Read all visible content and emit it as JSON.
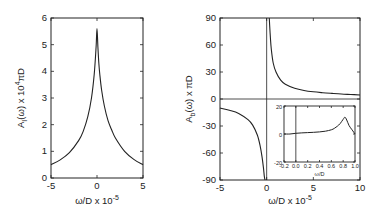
{
  "chart_data": [
    {
      "type": "line",
      "panel": "left",
      "ylabel": "A_I(ω) × 10^4 πD",
      "xlabel": "ω/D × 10^-5",
      "xlim": [
        -5,
        5
      ],
      "ylim": [
        0,
        6
      ],
      "xticks": [
        "-5",
        "0",
        "5"
      ],
      "yticks": [
        "0",
        "1",
        "2",
        "3",
        "4",
        "5",
        "6"
      ],
      "grid": false,
      "series": [
        {
          "name": "A_I",
          "x": [
            -5,
            -4,
            -3,
            -2,
            -1.5,
            -1,
            -0.6,
            -0.3,
            -0.1,
            0,
            0.1,
            0.2,
            0.3,
            0.5,
            0.8,
            1.2,
            1.6,
            2,
            3,
            4,
            5
          ],
          "y": [
            0.5,
            0.68,
            0.95,
            1.4,
            1.75,
            2.3,
            3.0,
            3.9,
            4.9,
            5.6,
            4.9,
            4.3,
            3.9,
            3.3,
            2.7,
            2.15,
            1.8,
            1.5,
            1.0,
            0.7,
            0.5
          ]
        }
      ]
    },
    {
      "type": "line",
      "panel": "right",
      "ylabel": "A_b(ω) × πD",
      "xlabel": "ω/D × 10^-5",
      "xlim": [
        -5,
        10
      ],
      "ylim": [
        -90,
        90
      ],
      "xticks": [
        "-5",
        "0",
        "5",
        "10"
      ],
      "yticks": [
        "-90",
        "-60",
        "-30",
        "0",
        "30",
        "60",
        "90"
      ],
      "grid": false,
      "reference_lines": {
        "y0": true,
        "x0": true
      },
      "series": [
        {
          "name": "A_b (ω<0)",
          "x": [
            -5,
            -4,
            -3,
            -2,
            -1.5,
            -1,
            -0.7,
            -0.5,
            -0.35,
            -0.25,
            -0.18
          ],
          "y": [
            -10,
            -12.5,
            -16,
            -23,
            -29,
            -40,
            -52,
            -64,
            -76,
            -86,
            -90
          ]
        },
        {
          "name": "A_b (ω>0)",
          "x": [
            0.28,
            0.32,
            0.4,
            0.5,
            0.7,
            1,
            1.5,
            2,
            3,
            4,
            5,
            6,
            7,
            8,
            9,
            10
          ],
          "y": [
            90,
            82,
            68,
            55,
            40,
            30,
            21,
            16.5,
            12,
            9.5,
            8,
            7,
            6.2,
            5.5,
            5,
            4.5
          ]
        }
      ],
      "inset": {
        "type": "line",
        "xlabel": "ω/D",
        "xlim": [
          -0.2,
          1.0
        ],
        "ylim": [
          -20,
          20
        ],
        "xticks": [
          "-0.2",
          "0.0",
          "0.2",
          "0.4",
          "0.6",
          "0.8",
          "1.0"
        ],
        "yticks": [
          "-20",
          "0",
          "20"
        ],
        "series": [
          {
            "name": "A_b wide range",
            "x": [
              -0.2,
              -0.1,
              0,
              0.1,
              0.2,
              0.3,
              0.4,
              0.5,
              0.6,
              0.65,
              0.7,
              0.75,
              0.8,
              0.83,
              0.86,
              0.9,
              0.95,
              1.0
            ],
            "y": [
              0,
              0,
              0.5,
              0.8,
              1,
              1.2,
              1.5,
              2,
              3,
              4,
              5.5,
              7.5,
              10.5,
              12,
              10,
              6,
              3,
              0
            ]
          }
        ]
      }
    }
  ],
  "labels": {
    "left_ylabel_main": "A",
    "left_ylabel_sub": "I",
    "left_ylabel_rest": "(ω)  x  10",
    "left_ylabel_sup": "4",
    "left_ylabel_end": "πD",
    "right_ylabel_main": "A",
    "right_ylabel_sub": "b",
    "right_ylabel_rest": "(ω)  x  πD",
    "xlabel_main": "ω/D  x 10",
    "xlabel_sup": "-5",
    "inset_xlabel": "ω/D"
  }
}
